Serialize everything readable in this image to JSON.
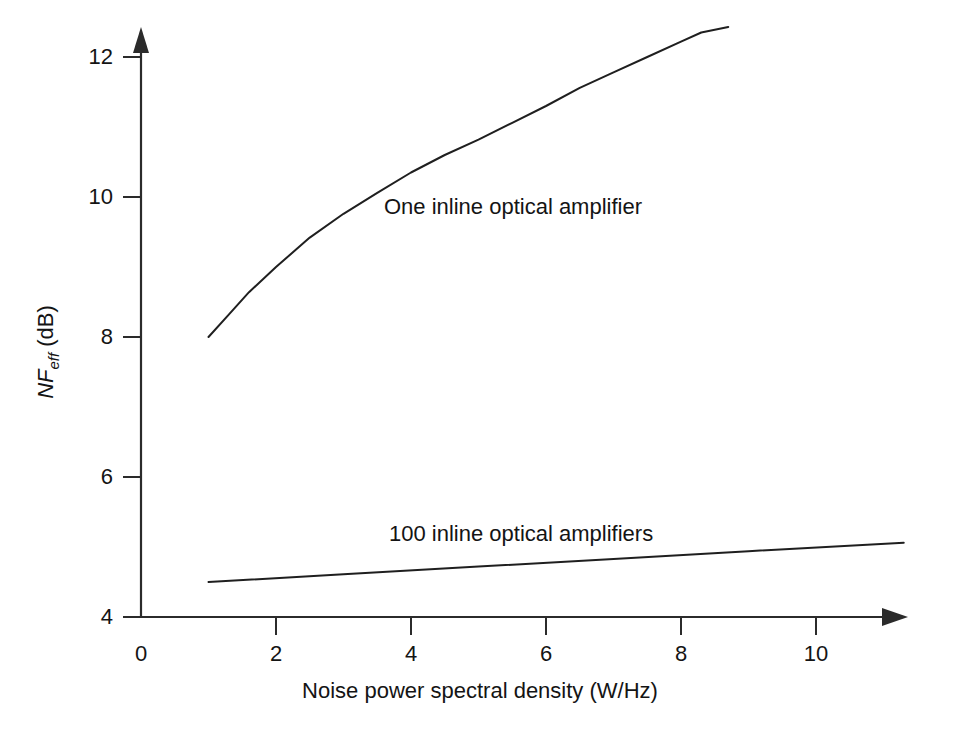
{
  "figure": {
    "background_color": "#ffffff",
    "ink_color": "#1f1f1f"
  },
  "chart_data": {
    "type": "line",
    "title": "",
    "subtitle": "",
    "xlabel": "Noise power spectral density (W/Hz)",
    "ylabel": "NF_eff (dB)",
    "ylabel_parts": {
      "symbol": "NF",
      "subscript": "eff",
      "unit": "(dB)"
    },
    "xlim": [
      0,
      11.3
    ],
    "ylim": [
      4,
      12.6
    ],
    "xticks": [
      0,
      2,
      4,
      6,
      8,
      10
    ],
    "xtick_labels": [
      "0",
      "2",
      "4",
      "6",
      "8",
      "10"
    ],
    "yticks": [
      4,
      6,
      8,
      10,
      12
    ],
    "ytick_labels": [
      "4",
      "6",
      "8",
      "10",
      "12"
    ],
    "grid": false,
    "legend_position": "inline-annotation",
    "axes_style": "arrow-tipped L-shaped axes",
    "series": [
      {
        "name": "One inline optical amplifier",
        "label_text": "One inline optical amplifier",
        "color": "#1f1f1f",
        "points": [
          {
            "x": 1.0,
            "y": 8.0
          },
          {
            "x": 1.3,
            "y": 8.32
          },
          {
            "x": 1.6,
            "y": 8.64
          },
          {
            "x": 2.0,
            "y": 9.0
          },
          {
            "x": 2.5,
            "y": 9.42
          },
          {
            "x": 3.0,
            "y": 9.76
          },
          {
            "x": 3.5,
            "y": 10.06
          },
          {
            "x": 4.0,
            "y": 10.35
          },
          {
            "x": 4.5,
            "y": 10.6
          },
          {
            "x": 5.0,
            "y": 10.82
          },
          {
            "x": 5.5,
            "y": 11.06
          },
          {
            "x": 6.0,
            "y": 11.3
          },
          {
            "x": 6.5,
            "y": 11.56
          },
          {
            "x": 7.0,
            "y": 11.78
          },
          {
            "x": 7.5,
            "y": 12.0
          },
          {
            "x": 8.0,
            "y": 12.22
          },
          {
            "x": 8.3,
            "y": 12.35
          },
          {
            "x": 8.7,
            "y": 12.43
          }
        ]
      },
      {
        "name": "100 inline optical amplifiers",
        "label_text": "100 inline optical amplifiers",
        "color": "#1f1f1f",
        "points": [
          {
            "x": 1.0,
            "y": 4.5
          },
          {
            "x": 3.0,
            "y": 4.61
          },
          {
            "x": 5.0,
            "y": 4.72
          },
          {
            "x": 7.0,
            "y": 4.83
          },
          {
            "x": 9.0,
            "y": 4.94
          },
          {
            "x": 11.3,
            "y": 5.06
          }
        ]
      }
    ]
  }
}
